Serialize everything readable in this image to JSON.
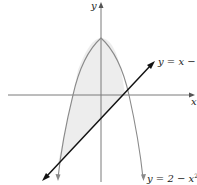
{
  "diagram": {
    "type": "function-graph",
    "axes": {
      "x_label": "x",
      "y_label": "y"
    },
    "curves": [
      {
        "name": "parabola",
        "equation_lhs": "y",
        "equation_rhs_a": "2 − x",
        "exponent": "2",
        "color": "#8a8a8a"
      },
      {
        "name": "line",
        "equation": "y = x − 2",
        "color": "#111111"
      }
    ],
    "shaded_region": {
      "description": "region between y = 2 − x² (above) and y = x − 2 (below)",
      "color": "#ededed"
    }
  },
  "labels": {
    "y_axis": "y",
    "x_axis": "x",
    "line": "y = x − 2",
    "parabola_base": "y = 2 − x",
    "parabola_exp": "2"
  }
}
